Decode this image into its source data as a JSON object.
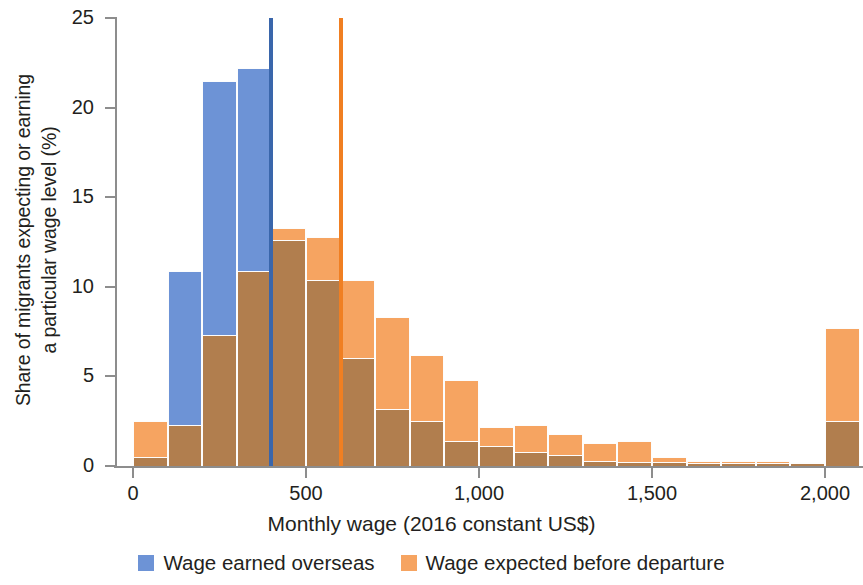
{
  "chart_data": {
    "type": "bar",
    "title": "",
    "subtitle": "",
    "xlabel": "Monthly wage (2016 constant US$)",
    "ylabel": "Share of migrants expecting or earning a particular wage level (%)",
    "ylabel_line1": "Share of migrants expecting or earning",
    "ylabel_line2": "a particular wage level (%)",
    "xlim": [
      0,
      2100
    ],
    "ylim": [
      0,
      25
    ],
    "grid": false,
    "legend_position": "bottom",
    "xticks": [
      0,
      500,
      1000,
      1500,
      2000
    ],
    "xtick_labels": [
      "0",
      "500",
      "1,000",
      "1,500",
      "2,000"
    ],
    "yticks": [
      0,
      5,
      10,
      15,
      20,
      25
    ],
    "ytick_labels": [
      "0",
      "5",
      "10",
      "15",
      "20",
      "25"
    ],
    "bin_width": 100,
    "bin_starts": [
      0,
      100,
      200,
      300,
      400,
      500,
      600,
      700,
      800,
      900,
      1000,
      1100,
      1200,
      1300,
      1400,
      1500,
      1600,
      1700,
      1800,
      1900,
      2000
    ],
    "bin_labels": [
      "0-100",
      "100-200",
      "200-300",
      "300-400",
      "400-500",
      "500-600",
      "600-700",
      "700-800",
      "800-900",
      "900-1,000",
      "1,000-1,100",
      "1,100-1,200",
      "1,200-1,300",
      "1,300-1,400",
      "1,400-1,500",
      "1,500-1,600",
      "1,600-1,700",
      "1,700-1,800",
      "1,800-1,900",
      "1,900-2,000",
      "2,000+"
    ],
    "series": [
      {
        "name": "Wage earned overseas",
        "color": "#6d93d6",
        "values": [
          0.5,
          10.9,
          21.5,
          22.2,
          12.6,
          10.4,
          6.0,
          3.2,
          2.5,
          1.4,
          1.1,
          0.8,
          0.6,
          0.3,
          0.2,
          0.2,
          0.15,
          0.15,
          0.15,
          0.15,
          2.5
        ]
      },
      {
        "name": "Wage expected before departure",
        "color": "#f6a461",
        "values": [
          2.5,
          2.3,
          7.3,
          10.9,
          13.3,
          12.8,
          10.4,
          8.3,
          6.2,
          4.8,
          2.2,
          2.3,
          1.8,
          1.3,
          1.4,
          0.5,
          0.3,
          0.3,
          0.3,
          0.2,
          7.7
        ]
      }
    ],
    "overlap_color": "#b17e4e",
    "reference_lines": [
      {
        "name": "mean wage earned overseas",
        "x": 400,
        "color": "#3a66ab",
        "value_top": 25
      },
      {
        "name": "mean wage expected before departure",
        "x": 600,
        "color": "#f07f22",
        "value_top": 25
      }
    ],
    "legend": [
      {
        "label": "Wage earned overseas",
        "color": "#6d93d6"
      },
      {
        "label": "Wage expected before departure",
        "color": "#f6a461"
      }
    ]
  }
}
